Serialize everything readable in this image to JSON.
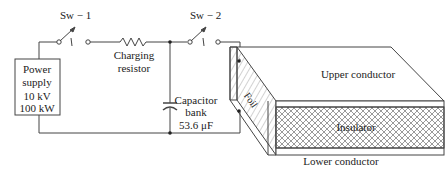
{
  "diagram": {
    "switches": [
      {
        "label": "Sw − 1"
      },
      {
        "label": "Sw − 2"
      }
    ],
    "power_supply": {
      "line1": "Power",
      "line2": "supply",
      "voltage": "10 kV",
      "power": "100 kW"
    },
    "resistor": {
      "line1": "Charging",
      "line2": "resistor"
    },
    "capacitor": {
      "line1": "Capacitor",
      "line2": "bank",
      "value": "53.6 μF"
    },
    "load": {
      "upper": "Upper conductor",
      "insulator": "Insulator",
      "lower": "Lower conductor",
      "foil": "Foil"
    }
  }
}
